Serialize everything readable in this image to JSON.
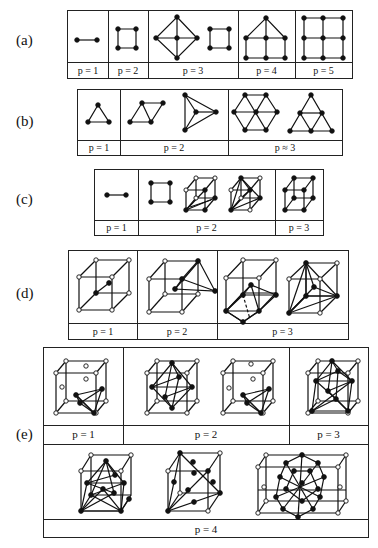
{
  "figure": {
    "rows": [
      {
        "id": "a",
        "label": "(a)",
        "dimension": "1D/2D quadrilateral",
        "cells": [
          {
            "p_label": "p = 1",
            "shapes": [
              "segment"
            ]
          },
          {
            "p_label": "p = 2",
            "shapes": [
              "square"
            ]
          },
          {
            "p_label": "p = 3",
            "shapes": [
              "diamond-with-cross",
              "square"
            ]
          },
          {
            "p_label": "p = 4",
            "shapes": [
              "house-grid"
            ]
          },
          {
            "p_label": "p = 5",
            "shapes": [
              "3x3-grid"
            ]
          }
        ]
      },
      {
        "id": "b",
        "label": "(b)",
        "dimension": "2D triangle",
        "cells": [
          {
            "p_label": "p = 1",
            "shapes": [
              "triangle"
            ]
          },
          {
            "p_label": "p = 2",
            "shapes": [
              "parallelogram-of-triangles",
              "star-triangle"
            ]
          },
          {
            "p_label": "p ≈ 3",
            "shapes": [
              "hexagon-of-triangles",
              "subdivided-triangle"
            ]
          }
        ]
      },
      {
        "id": "c",
        "label": "(c)",
        "dimension": "mixed 1D/2D/3D",
        "cells": [
          {
            "p_label": "p = 1",
            "shapes": [
              "segment"
            ]
          },
          {
            "p_label": "p = 2",
            "shapes": [
              "square",
              "cube-with-inner-triangles",
              "cube-with-tetrahedra"
            ]
          },
          {
            "p_label": "p = 3",
            "shapes": [
              "cube-all-filled"
            ]
          }
        ]
      },
      {
        "id": "d",
        "label": "(d)",
        "dimension": "3D cube stencils",
        "cells": [
          {
            "p_label": "p = 1",
            "shapes": [
              "cube-with-center-segment"
            ]
          },
          {
            "p_label": "p = 2",
            "shapes": [
              "cube-with-triangle"
            ]
          },
          {
            "p_label": "p = 3",
            "shapes": [
              "cube-with-pyramid",
              "cube-with-tetrahedral-fan"
            ]
          }
        ]
      },
      {
        "id": "e",
        "label": "(e)",
        "dimension": "3D face-centred stencils",
        "cells": [
          {
            "p_label": "p = 1",
            "shapes": [
              "fcc-cube-with-tetrahedron"
            ]
          },
          {
            "p_label": "p = 2",
            "shapes": [
              "fcc-cube-with-octahedron",
              "fcc-cube-with-tetrahedron"
            ]
          },
          {
            "p_label": "p = 3",
            "shapes": [
              "fcc-cube-dense"
            ]
          },
          {
            "p_label": "p = 4",
            "shapes": [
              "fcc-cluster-1",
              "fcc-cluster-2",
              "fcc-cluster-3"
            ]
          }
        ]
      }
    ],
    "legend": {
      "filled_node": "active point",
      "open_node": "inactive point"
    }
  }
}
